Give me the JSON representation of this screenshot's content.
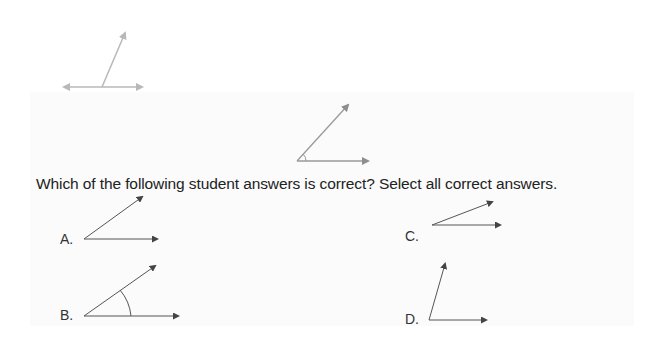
{
  "question": {
    "text": "Which of the following student answers is correct? Select all correct answers."
  },
  "figures": {
    "top_example": {
      "description": "ray rising from a line with arrows on both ends",
      "color": "#b8b8b8"
    },
    "reference_angle": {
      "description": "acute angle with small arc marked at vertex",
      "color": "#9a9a9a"
    }
  },
  "options": [
    {
      "letter": "A.",
      "description": "acute angle, no arc marking"
    },
    {
      "letter": "B.",
      "description": "acute angle with arc marking"
    },
    {
      "letter": "C.",
      "description": "narrow acute angle, no arc marking"
    },
    {
      "letter": "D.",
      "description": "angle with steep ray, no arc marking"
    }
  ],
  "colors": {
    "text": "#222222",
    "figure_lines": "#555555",
    "band_background": "#fbfbfb"
  }
}
